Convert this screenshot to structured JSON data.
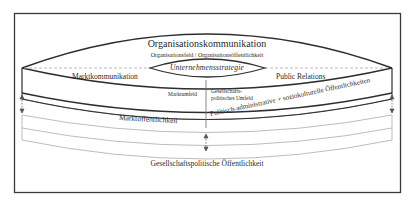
{
  "diagram": {
    "title": "Organisationskommunikation",
    "subtitle": "Organisationsfeld / Organisationsöffentlichkeit",
    "center": "Unternehmensstrategie",
    "left_upper": "Marktkommunikation",
    "right_upper": "Public Relations",
    "left_field": "Marktumfeld",
    "right_field": "Gesellschafts-politisches Umfeld",
    "left_public": "Marktöffentlichkeit",
    "right_public": "Politisch-administrative + soziokulturelle Öffentlichkeiten",
    "bottom_public": "Gesellschaftspolitische Öffentlichkeit"
  },
  "colors": {
    "frame": "#3a3a3a",
    "line_dark": "#2e2e2e",
    "line_light": "#b8b8b8",
    "text": "#2a2a2a"
  }
}
